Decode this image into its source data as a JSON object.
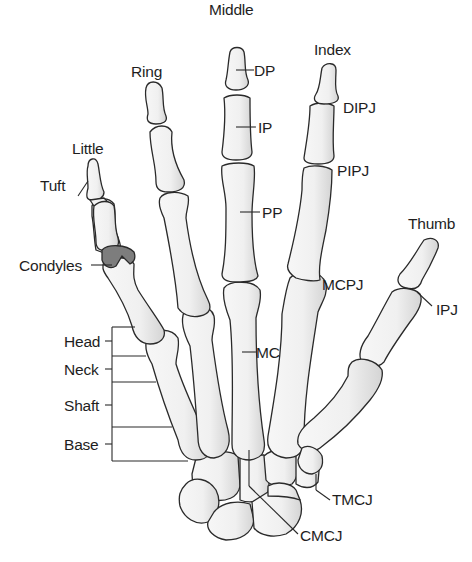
{
  "diagram": {
    "fingers": {
      "middle": "Middle",
      "index": "Index",
      "ring": "Ring",
      "little": "Little",
      "thumb": "Thumb"
    },
    "bone_labels": {
      "dp": "DP",
      "ip": "IP",
      "pp": "PP",
      "mc": "MC"
    },
    "joint_labels": {
      "dipj": "DIPJ",
      "pipj": "PIPJ",
      "mcpj": "MCPJ",
      "ipj": "IPJ",
      "tmcj": "TMCJ",
      "cmcj": "CMCJ"
    },
    "feature_labels": {
      "tuft": "Tuft",
      "condyles": "Condyles"
    },
    "metacarpal_regions": {
      "head": "Head",
      "neck": "Neck",
      "shaft": "Shaft",
      "base": "Base"
    },
    "colors": {
      "bone_fill": "#f4f4f4",
      "bone_shade": "#d6d6d6",
      "outline": "#2a2a2a",
      "condyle_fill": "#7d7d7d",
      "background": "#ffffff"
    }
  }
}
